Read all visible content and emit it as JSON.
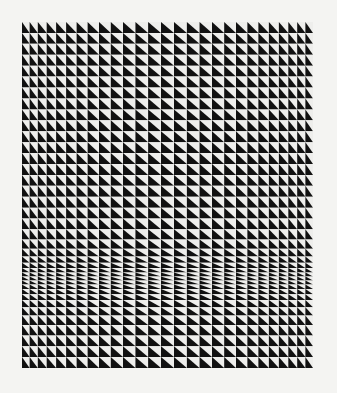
{
  "artwork": {
    "description": "Op-art grid of black and white right triangles",
    "background_color": "#f4f4f2",
    "ink_color": "#111111",
    "paper_color": "#eeeeec",
    "frame": {
      "x0": 22,
      "y0": 22,
      "x1": 313,
      "y1": 368
    },
    "columns": {
      "count": 27,
      "edge_width": 7,
      "center_width": 12.5
    },
    "rows": {
      "count": 38,
      "base_height": 11,
      "compress_center_y": 278,
      "compress_min_height": 4,
      "compress_spread": 22
    },
    "triangle_orientation": "black lower-left, white upper-right"
  }
}
